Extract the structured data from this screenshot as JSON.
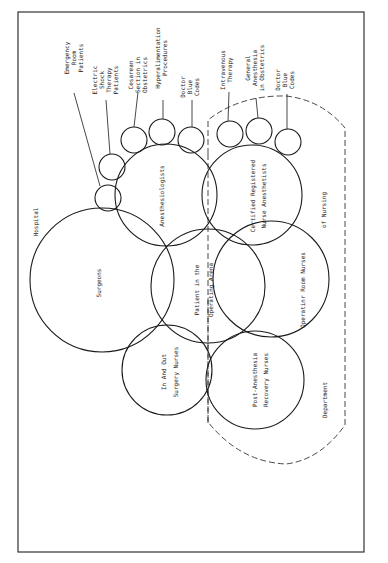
{
  "frame": {
    "label": "Hospital"
  },
  "department_region": {
    "label_line1": "of Nursing",
    "label_line2": "Department"
  },
  "major_circles": [
    {
      "id": "surgeons",
      "lines": [
        "Surgeons"
      ]
    },
    {
      "id": "anesthesiologists",
      "lines": [
        "Anesthesiologists"
      ]
    },
    {
      "id": "crna",
      "lines": [
        "Certified Registered",
        "Nurse Anesthetists"
      ]
    },
    {
      "id": "patient",
      "lines": [
        "Patient in the",
        "Operating Arena"
      ]
    },
    {
      "id": "or-nurses",
      "lines": [
        "Operatinr Room Nurses"
      ]
    },
    {
      "id": "in-out",
      "lines": [
        "In And Out",
        "Surgery Nurses"
      ]
    },
    {
      "id": "pacu",
      "lines": [
        "Post-Anesthesia",
        "Recovery Nurses"
      ]
    }
  ],
  "minor_circles": [
    {
      "id": "er",
      "lines": [
        "Emergency",
        "Room",
        "Patients"
      ]
    },
    {
      "id": "ect",
      "lines": [
        "Electric",
        "Shock",
        "Therapy",
        "Patients"
      ]
    },
    {
      "id": "cesarean",
      "lines": [
        "Cesarean",
        "Section in",
        "Obstetrics"
      ]
    },
    {
      "id": "hyperal",
      "lines": [
        "Hyperalimentation",
        "Procedures"
      ]
    },
    {
      "id": "doctor-codes-1",
      "lines": [
        "Doctor",
        "Blue",
        "Codes"
      ]
    },
    {
      "id": "iv",
      "lines": [
        "Intravenous",
        "Therapy"
      ]
    },
    {
      "id": "general-ob",
      "lines": [
        "General",
        "Anesthesia",
        "in Obstetrics"
      ]
    },
    {
      "id": "doctor-codes-2",
      "lines": [
        "Doctor",
        "Blue",
        "Codes"
      ]
    }
  ]
}
